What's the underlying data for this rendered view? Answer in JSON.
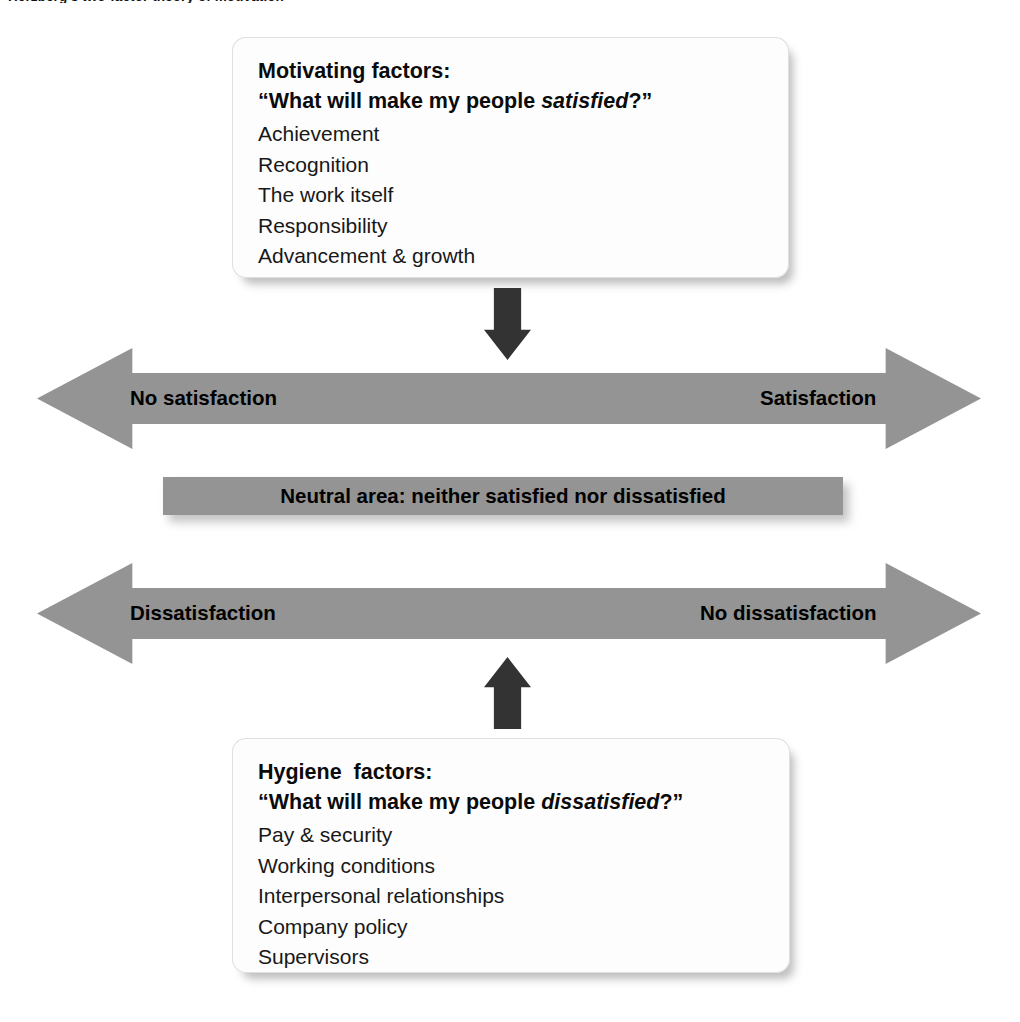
{
  "page": {
    "clipped_top_caption": "Herzberg's two-factor theory of motivation"
  },
  "motivating": {
    "heading": "Motivating factors:",
    "question_prefix": "“What will make my people ",
    "question_emphasis": "satisfied",
    "question_suffix": "?”",
    "items": [
      "Achievement",
      "Recognition",
      "The work itself",
      "Responsibility",
      "Advancement & growth"
    ]
  },
  "hygiene": {
    "heading": "Hygiene  factors:",
    "question_prefix": "“What will make my people ",
    "question_emphasis": "dissatisfied",
    "question_suffix": "?”",
    "items": [
      "Pay & security",
      "Working conditions",
      "Interpersonal relationships",
      "Company policy",
      "Supervisors"
    ]
  },
  "satisfaction_axis": {
    "left_label": "No satisfaction",
    "right_label": "Satisfaction"
  },
  "neutral_band": {
    "label": "Neutral area: neither satisfied nor dissatisfied"
  },
  "dissatisfaction_axis": {
    "left_label": "Dissatisfaction",
    "right_label": "No dissatisfaction"
  },
  "icons": {
    "arrow_down": "arrow-down-icon",
    "arrow_up": "arrow-up-icon",
    "double_arrow": "double-headed-arrow-icon"
  },
  "colors": {
    "background": "#ffffff",
    "band_gray": "#949494",
    "connector_dark": "#333333",
    "box_fill": "#fdfdfd",
    "text": "#0b0b0b"
  }
}
